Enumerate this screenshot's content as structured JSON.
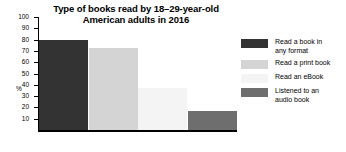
{
  "chart_data": {
    "type": "bar",
    "title": "Type of books read by 18–29-year-old American adults in 2016",
    "title_line1": "Type of books read by 18–29-year-old",
    "title_line2": "American adults in 2016",
    "xlabel": "",
    "ylabel": "%",
    "ylim": [
      0,
      100
    ],
    "yticks": [
      100,
      90,
      80,
      70,
      60,
      50,
      40,
      30,
      20,
      10
    ],
    "grid": false,
    "legend_position": "right",
    "categories": [
      "Read a book in any format",
      "Read a print book",
      "Read an eBook",
      "Listened to an audio book"
    ],
    "values": [
      80,
      73,
      37,
      17
    ],
    "colors": [
      "#333333",
      "#d4d4d4",
      "#f4f4f4",
      "#6e6e6e"
    ]
  },
  "legend": {
    "items": [
      {
        "label": "Read a book in\nany format",
        "color": "#333333"
      },
      {
        "label": "Read a print book",
        "color": "#d4d4d4"
      },
      {
        "label": "Read an eBook",
        "color": "#f4f4f4"
      },
      {
        "label": "Listened to an\naudio book",
        "color": "#6e6e6e"
      }
    ]
  }
}
